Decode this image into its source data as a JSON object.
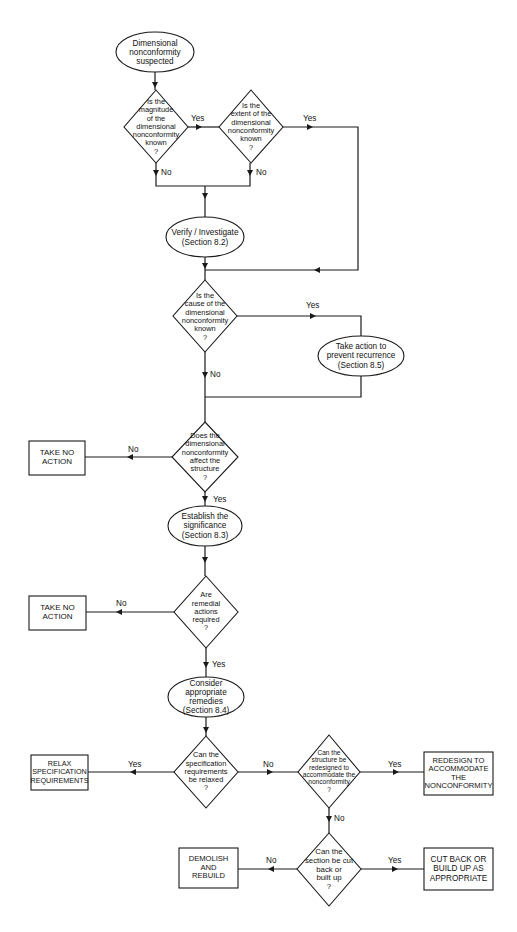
{
  "flowchart": {
    "colors": {
      "stroke": "#1a1a1a",
      "fill": "#ffffff",
      "text": "#111111"
    },
    "nodes": {
      "start": {
        "type": "ellipse",
        "text": "Dimensional\nnonconformity\nsuspected"
      },
      "q_magnitude": {
        "type": "diamond",
        "text": "Is the\nmagnitude\nof the\ndimensional\nnonconformity\nknown\n?"
      },
      "q_extent": {
        "type": "diamond",
        "text": "Is the\nextent of the\ndimensional\nnonconformity\nknown\n?"
      },
      "verify": {
        "type": "ellipse",
        "text": "Verify / Investigate\n(Section 8.2)"
      },
      "q_cause": {
        "type": "diamond",
        "text": "Is the\ncause of the\ndimensional\nnonconformity\nknown\n?"
      },
      "prevent": {
        "type": "ellipse",
        "text": "Take action to\nprevent recurrence\n(Section 8.5)"
      },
      "q_affect": {
        "type": "diamond",
        "text": "Does the\ndimensional\nnonconformity\naffect the\nstructure\n?"
      },
      "no_action_1": {
        "type": "box",
        "text": "TAKE NO\nACTION"
      },
      "significance": {
        "type": "ellipse",
        "text": "Establish the\nsignificance\n(Section 8.3)"
      },
      "q_remedial": {
        "type": "diamond",
        "text": "Are\nremedial\nactions\nrequired\n?"
      },
      "no_action_2": {
        "type": "box",
        "text": "TAKE NO\nACTION"
      },
      "remedies": {
        "type": "ellipse",
        "text": "Consider\nappropriate remedies\n(Section 8.4)"
      },
      "q_relax": {
        "type": "diamond",
        "text": "Can the\nspecification\nrequirements\nbe relaxed\n?"
      },
      "relax": {
        "type": "box",
        "text": "RELAX\nSPECIFICATION\nREQUIREMENTS"
      },
      "q_redesign": {
        "type": "diamond",
        "text": "Can the\nstructure be\nredesigned to\naccommodate the\nnonconformity\n?"
      },
      "redesign": {
        "type": "box",
        "text": "REDESIGN TO\nACCOMMODATE\nTHE\nNONCONFORMITY"
      },
      "q_cutback": {
        "type": "diamond",
        "text": "Can the\nsection be cut\nback or\nbuilt up\n?"
      },
      "demolish": {
        "type": "box",
        "text": "DEMOLISH\nAND\nREBUILD"
      },
      "cutback": {
        "type": "box",
        "text": "CUT BACK OR\nBUILD UP AS\nAPPROPRIATE"
      }
    },
    "edge_labels": {
      "magnitude_yes": "Yes",
      "magnitude_no": "No",
      "extent_yes": "Yes",
      "extent_no": "No",
      "cause_yes": "Yes",
      "cause_no": "No",
      "affect_no": "No",
      "affect_yes": "Yes",
      "remedial_no": "No",
      "remedial_yes": "Yes",
      "relax_yes": "Yes",
      "relax_no": "No",
      "redesign_yes": "Yes",
      "redesign_no": "No",
      "cutback_no": "No",
      "cutback_yes": "Yes"
    }
  }
}
